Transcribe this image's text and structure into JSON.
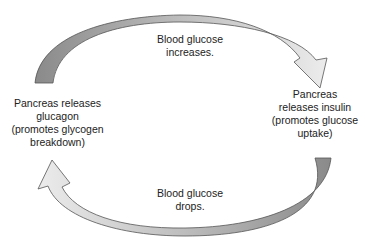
{
  "diagram": {
    "top_arrow": {
      "label_lines": [
        "Blood glucose",
        "increases."
      ],
      "gradient_start": "#8a8a8a",
      "gradient_end": "#ececec"
    },
    "bottom_arrow": {
      "label_lines": [
        "Blood glucose",
        "drops."
      ],
      "gradient_start": "#8a8a8a",
      "gradient_end": "#ececec"
    },
    "left_node": {
      "lines": [
        "Pancreas releases",
        "glucagon",
        "(promotes glycogen",
        "breakdown)"
      ]
    },
    "right_node": {
      "lines": [
        "Pancreas",
        "releases insulin",
        "(promotes glucose",
        "uptake)"
      ]
    }
  }
}
